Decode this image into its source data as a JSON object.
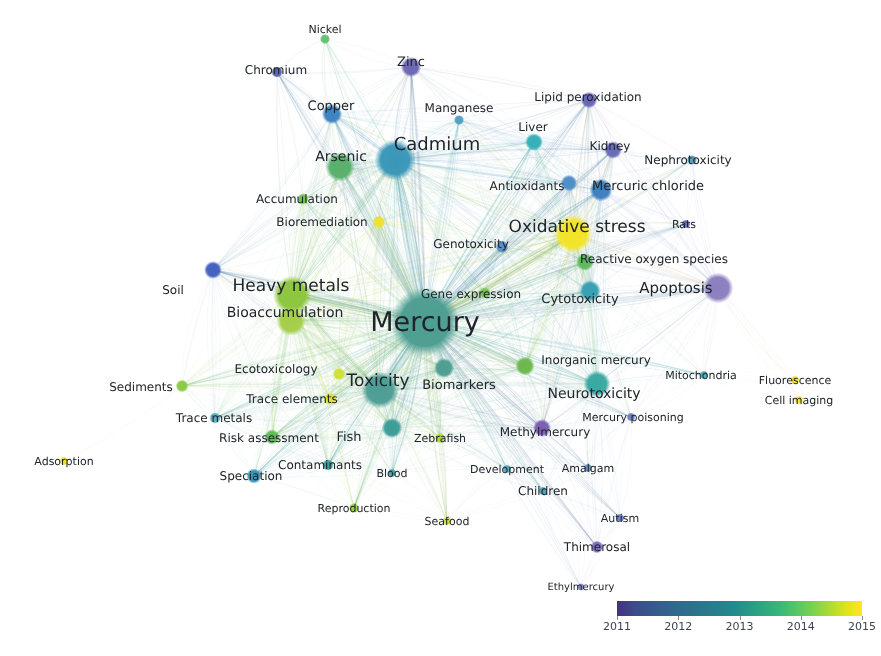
{
  "map": {
    "title": "Keyword co-occurrence network map",
    "background_color": "#ffffff",
    "width": 881,
    "height": 656
  },
  "legend": {
    "name": "average-publication-year-colorbar",
    "type": "continuous-color-scale",
    "colors": [
      "#46327e",
      "#33628d",
      "#238a8d",
      "#6ece58",
      "#fde725"
    ],
    "ticks": [
      {
        "label": "2011",
        "pos": 0.0
      },
      {
        "label": "2012",
        "pos": 0.25
      },
      {
        "label": "2013",
        "pos": 0.5
      },
      {
        "label": "2014",
        "pos": 0.75
      },
      {
        "label": "2015",
        "pos": 1.0
      }
    ]
  },
  "chart_data": {
    "type": "scatter",
    "xlabel": "",
    "ylabel": "",
    "colorbar": {
      "label": "",
      "min": 2011,
      "max": 2015,
      "ticks": [
        2011,
        2012,
        2013,
        2014,
        2015
      ]
    },
    "nodes": [
      {
        "label": "Mercury",
        "x": 425,
        "y": 322,
        "r": 27,
        "color": "#4e9e92",
        "font": 27,
        "lx": 425,
        "ly": 322,
        "year": 2013.1
      },
      {
        "label": "Cadmium",
        "x": 395,
        "y": 160,
        "r": 16,
        "color": "#3a97b8",
        "font": 18,
        "lx": 437,
        "ly": 144,
        "year": 2012.6
      },
      {
        "label": "Oxidative stress",
        "x": 573,
        "y": 234,
        "r": 15,
        "color": "#f2e429",
        "font": 17,
        "lx": 577,
        "ly": 227,
        "year": 2014.9
      },
      {
        "label": "Heavy metals",
        "x": 292,
        "y": 295,
        "r": 15,
        "color": "#8ec63f",
        "font": 17,
        "lx": 291,
        "ly": 286,
        "year": 2014.1
      },
      {
        "label": "Toxicity",
        "x": 380,
        "y": 390,
        "r": 14.5,
        "color": "#4d9e95",
        "font": 17,
        "lx": 378,
        "ly": 381,
        "year": 2013.2
      },
      {
        "label": "Apoptosis",
        "x": 718,
        "y": 288,
        "r": 12,
        "color": "#8c7fc0",
        "font": 15,
        "lx": 676,
        "ly": 288,
        "year": 2011.5
      },
      {
        "label": "Arsenic",
        "x": 340,
        "y": 167,
        "r": 11.5,
        "color": "#58b06b",
        "font": 14,
        "lx": 341,
        "ly": 157,
        "year": 2013.6
      },
      {
        "label": "Bioaccumulation",
        "x": 291,
        "y": 321,
        "r": 11.5,
        "color": "#a5cf4a",
        "font": 14,
        "lx": 285,
        "ly": 313,
        "year": 2014.0
      },
      {
        "label": "Neurotoxicity",
        "x": 597,
        "y": 384,
        "r": 10.5,
        "color": "#3aa8a3",
        "font": 14,
        "lx": 594,
        "ly": 394,
        "year": 2013.0
      },
      {
        "label": "Biomarkers",
        "x": 444,
        "y": 368,
        "r": 8,
        "color": "#4e9e92",
        "font": 13,
        "lx": 459,
        "ly": 385,
        "year": 2013.2
      },
      {
        "label": "Mercuric chloride",
        "x": 601,
        "y": 190,
        "r": 9,
        "color": "#3e7fbf",
        "font": 13,
        "lx": 648,
        "ly": 186,
        "year": 2011.9
      },
      {
        "label": "Cytotoxicity",
        "x": 590,
        "y": 291,
        "r": 8.5,
        "color": "#38a0b4",
        "font": 13,
        "lx": 580,
        "ly": 299,
        "year": 2012.8
      },
      {
        "label": "Reactive oxygen species",
        "x": 585,
        "y": 262,
        "r": 7,
        "color": "#5fb85e",
        "font": 12,
        "lx": 654,
        "ly": 259,
        "year": 2013.8
      },
      {
        "label": "Copper",
        "x": 332,
        "y": 114,
        "r": 8,
        "color": "#3f83c2",
        "font": 13,
        "lx": 331,
        "ly": 106,
        "year": 2012.0
      },
      {
        "label": "Zinc",
        "x": 411,
        "y": 67,
        "r": 8,
        "color": "#6e68b4",
        "font": 13,
        "lx": 411,
        "ly": 62,
        "year": 2011.4
      },
      {
        "label": "Fish",
        "x": 392,
        "y": 428,
        "r": 8,
        "color": "#3c9d98",
        "font": 13,
        "lx": 349,
        "ly": 437,
        "year": 2013.0
      },
      {
        "label": "Kidney",
        "x": 613,
        "y": 150,
        "r": 7,
        "color": "#6a6bb8",
        "font": 12,
        "lx": 610,
        "ly": 146,
        "year": 2011.5
      },
      {
        "label": "Antioxidants",
        "x": 569,
        "y": 183,
        "r": 6.5,
        "color": "#4f8fc8",
        "font": 12,
        "lx": 527,
        "ly": 186,
        "year": 2012.3
      },
      {
        "label": "Liver",
        "x": 534,
        "y": 142,
        "r": 7,
        "color": "#37b0b8",
        "font": 12,
        "lx": 533,
        "ly": 127,
        "year": 2012.6
      },
      {
        "label": "Lipid peroxidation",
        "x": 589,
        "y": 100,
        "r": 6.5,
        "color": "#6a65b6",
        "font": 12,
        "lx": 588,
        "ly": 97,
        "year": 2011.4
      },
      {
        "label": "Methylmercury",
        "x": 542,
        "y": 428,
        "r": 7,
        "color": "#7a5fb5",
        "font": 12,
        "lx": 545,
        "ly": 432,
        "year": 2011.6
      },
      {
        "label": "Inorganic mercury",
        "x": 525,
        "y": 366,
        "r": 7.5,
        "color": "#6cb84f",
        "font": 12,
        "lx": 596,
        "ly": 360,
        "year": 2013.9
      },
      {
        "label": "Genotoxicity",
        "x": 502,
        "y": 247,
        "r": 5,
        "color": "#5a8dc6",
        "font": 12,
        "lx": 471,
        "ly": 244,
        "year": 2012.4
      },
      {
        "label": "Gene expression",
        "x": 485,
        "y": 293,
        "r": 4.5,
        "color": "#76c14e",
        "font": 12,
        "lx": 471,
        "ly": 294,
        "year": 2013.9
      },
      {
        "label": "Ecotoxicology",
        "x": 339,
        "y": 374,
        "r": 5,
        "color": "#cfe03a",
        "font": 12,
        "lx": 276,
        "ly": 369,
        "year": 2014.3
      },
      {
        "label": "Trace elements",
        "x": 330,
        "y": 399,
        "r": 5,
        "color": "#dfe232",
        "font": 12,
        "lx": 292,
        "ly": 399,
        "year": 2014.5
      },
      {
        "label": "Risk assessment",
        "x": 272,
        "y": 437,
        "r": 6,
        "color": "#62b75b",
        "font": 12,
        "lx": 269,
        "ly": 438,
        "year": 2013.7
      },
      {
        "label": "Speciation",
        "x": 254,
        "y": 476,
        "r": 6,
        "color": "#3494b7",
        "font": 12,
        "lx": 251,
        "ly": 476,
        "year": 2012.5
      },
      {
        "label": "Contaminants",
        "x": 328,
        "y": 465,
        "r": 4.5,
        "color": "#3f9d9a",
        "font": 12,
        "lx": 320,
        "ly": 465,
        "year": 2013.0
      },
      {
        "label": "Trace metals",
        "x": 215,
        "y": 418,
        "r": 4.5,
        "color": "#5aadc0",
        "font": 12,
        "lx": 214,
        "ly": 418,
        "year": 2012.8
      },
      {
        "label": "Sediments",
        "x": 182,
        "y": 386,
        "r": 5,
        "color": "#8ccb45",
        "font": 12,
        "lx": 141,
        "ly": 387,
        "year": 2014.0
      },
      {
        "label": "Soil",
        "x": 213,
        "y": 270,
        "r": 7,
        "color": "#4661c0",
        "font": 12,
        "lx": 173,
        "ly": 290,
        "year": 2011.3
      },
      {
        "label": "Accumulation",
        "x": 303,
        "y": 199,
        "r": 4.5,
        "color": "#74c14f",
        "font": 12,
        "lx": 297,
        "ly": 199,
        "year": 2013.8
      },
      {
        "label": "Bioremediation",
        "x": 379,
        "y": 222,
        "r": 5,
        "color": "#f0e030",
        "font": 12,
        "lx": 322,
        "ly": 222,
        "year": 2014.9
      },
      {
        "label": "Manganese",
        "x": 459,
        "y": 120,
        "r": 4,
        "color": "#53a0c4",
        "font": 12,
        "lx": 459,
        "ly": 108,
        "year": 2012.4
      },
      {
        "label": "Nickel",
        "x": 325,
        "y": 39,
        "r": 4,
        "color": "#64c272",
        "font": 11,
        "lx": 325,
        "ly": 29,
        "year": 2013.5
      },
      {
        "label": "Chromium",
        "x": 277,
        "y": 72,
        "r": 4.5,
        "color": "#5a62b8",
        "font": 12,
        "lx": 276,
        "ly": 70,
        "year": 2011.6
      },
      {
        "label": "Nephrotoxicity",
        "x": 692,
        "y": 160,
        "r": 4,
        "color": "#5b9cc2",
        "font": 12,
        "lx": 688,
        "ly": 160,
        "year": 2012.2
      },
      {
        "label": "Rats",
        "x": 686,
        "y": 224,
        "r": 3.5,
        "color": "#6370b8",
        "font": 11,
        "lx": 684,
        "ly": 224,
        "year": 2011.8
      },
      {
        "label": "Mitochondria",
        "x": 704,
        "y": 375,
        "r": 3.5,
        "color": "#53a8bd",
        "font": 11,
        "lx": 701,
        "ly": 375,
        "year": 2012.7
      },
      {
        "label": "Mercury poisoning",
        "x": 631,
        "y": 417,
        "r": 3.5,
        "color": "#6f83c4",
        "font": 11,
        "lx": 633,
        "ly": 417,
        "year": 2012.1
      },
      {
        "label": "Zebrafish",
        "x": 440,
        "y": 438,
        "r": 4,
        "color": "#b0d53c",
        "font": 11,
        "lx": 440,
        "ly": 438,
        "year": 2014.2
      },
      {
        "label": "Blood",
        "x": 392,
        "y": 473,
        "r": 3.5,
        "color": "#4d9fa8",
        "font": 11,
        "lx": 392,
        "ly": 473,
        "year": 2012.9
      },
      {
        "label": "Development",
        "x": 507,
        "y": 469,
        "r": 3.5,
        "color": "#5aa8c0",
        "font": 11,
        "lx": 507,
        "ly": 469,
        "year": 2012.6
      },
      {
        "label": "Amalgam",
        "x": 588,
        "y": 468,
        "r": 3.5,
        "color": "#6f8cc6",
        "font": 11,
        "lx": 588,
        "ly": 468,
        "year": 2012.2
      },
      {
        "label": "Children",
        "x": 543,
        "y": 491,
        "r": 3.5,
        "color": "#4fa5c0",
        "font": 12,
        "lx": 543,
        "ly": 491,
        "year": 2012.6
      },
      {
        "label": "Autism",
        "x": 620,
        "y": 518,
        "r": 3.5,
        "color": "#6f7fc4",
        "font": 11,
        "lx": 620,
        "ly": 518,
        "year": 2011.9
      },
      {
        "label": "Thimerosal",
        "x": 597,
        "y": 547,
        "r": 5,
        "color": "#7d6bbd",
        "font": 12,
        "lx": 597,
        "ly": 547,
        "year": 2011.5
      },
      {
        "label": "Ethylmercury",
        "x": 581,
        "y": 587,
        "r": 3,
        "color": "#7f86c4",
        "font": 10,
        "lx": 581,
        "ly": 587,
        "year": 2011.8
      },
      {
        "label": "Seafood",
        "x": 447,
        "y": 521,
        "r": 3.5,
        "color": "#cbdb3b",
        "font": 11,
        "lx": 447,
        "ly": 521,
        "year": 2014.3
      },
      {
        "label": "Reproduction",
        "x": 354,
        "y": 508,
        "r": 4,
        "color": "#9ed045",
        "font": 11,
        "lx": 354,
        "ly": 508,
        "year": 2014.0
      },
      {
        "label": "Adsorption",
        "x": 64,
        "y": 461,
        "r": 3.5,
        "color": "#ecdf2e",
        "font": 11,
        "lx": 64,
        "ly": 461,
        "year": 2014.8
      },
      {
        "label": "Fluorescence",
        "x": 795,
        "y": 380,
        "r": 3.5,
        "color": "#f3e42a",
        "font": 11,
        "lx": 795,
        "ly": 380,
        "year": 2015.0
      },
      {
        "label": "Cell imaging",
        "x": 799,
        "y": 400,
        "r": 3.5,
        "color": "#f3e42a",
        "font": 11,
        "lx": 799,
        "ly": 400,
        "year": 2015.0
      }
    ]
  }
}
